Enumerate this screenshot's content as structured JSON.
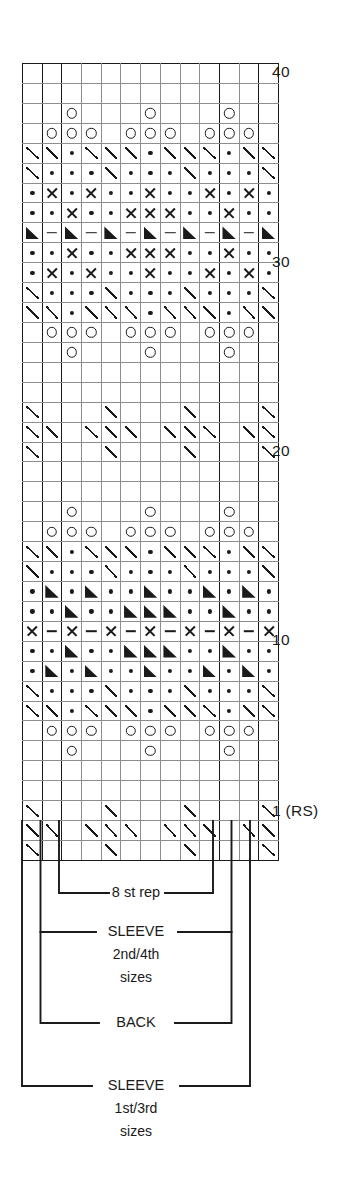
{
  "chart": {
    "columns": 13,
    "rows": 40,
    "row_labels": [
      {
        "row": 40,
        "text": "40"
      },
      {
        "row": 30,
        "text": "30"
      },
      {
        "row": 20,
        "text": "20"
      },
      {
        "row": 10,
        "text": "10"
      },
      {
        "row": 1,
        "text": "1 (RS)"
      }
    ],
    "heavy_column_lines": [
      0,
      1,
      2,
      10,
      12,
      13
    ],
    "symbol_legend": {
      "slash": "k2tog-decrease-slash",
      "dot": "purl-dot",
      "circle": "yarn-over-circle",
      "cross": "cross-x",
      "dash": "horizontal-dash",
      "tri": "filled-triangle",
      "blank": "knit-blank"
    },
    "grid": [
      [
        "blank",
        "blank",
        "blank",
        "blank",
        "blank",
        "blank",
        "blank",
        "blank",
        "blank",
        "blank",
        "blank",
        "blank",
        "blank"
      ],
      [
        "blank",
        "blank",
        "blank",
        "blank",
        "blank",
        "blank",
        "blank",
        "blank",
        "blank",
        "blank",
        "blank",
        "blank",
        "blank"
      ],
      [
        "blank",
        "blank",
        "circle",
        "blank",
        "blank",
        "blank",
        "circle",
        "blank",
        "blank",
        "blank",
        "circle",
        "blank",
        "blank"
      ],
      [
        "blank",
        "circle",
        "circle",
        "circle",
        "blank",
        "circle",
        "circle",
        "circle",
        "blank",
        "circle",
        "circle",
        "circle",
        "blank"
      ],
      [
        "slash",
        "slash",
        "dot",
        "slash",
        "slash",
        "slash",
        "dot",
        "slash",
        "slash",
        "slash",
        "dot",
        "slash",
        "slash"
      ],
      [
        "slash",
        "dot",
        "dot",
        "dot",
        "slash",
        "dot",
        "dot",
        "dot",
        "slash",
        "dot",
        "dot",
        "dot",
        "slash"
      ],
      [
        "dot",
        "cross",
        "dot",
        "cross",
        "dot",
        "dot",
        "cross",
        "dot",
        "dot",
        "cross",
        "dot",
        "cross",
        "dot"
      ],
      [
        "dot",
        "dot",
        "cross",
        "dot",
        "dot",
        "cross",
        "cross",
        "cross",
        "dot",
        "dot",
        "cross",
        "dot",
        "dot"
      ],
      [
        "tri",
        "dash",
        "tri",
        "dash",
        "tri",
        "dash",
        "tri",
        "dash",
        "tri",
        "dash",
        "tri",
        "dash",
        "tri"
      ],
      [
        "dot",
        "dot",
        "cross",
        "dot",
        "dot",
        "cross",
        "cross",
        "cross",
        "dot",
        "dot",
        "cross",
        "dot",
        "dot"
      ],
      [
        "dot",
        "cross",
        "dot",
        "cross",
        "dot",
        "dot",
        "cross",
        "dot",
        "dot",
        "cross",
        "dot",
        "cross",
        "dot"
      ],
      [
        "slash",
        "dot",
        "dot",
        "dot",
        "slash",
        "dot",
        "dot",
        "dot",
        "slash",
        "dot",
        "dot",
        "dot",
        "slash"
      ],
      [
        "slash",
        "slash",
        "dot",
        "slash",
        "slash",
        "slash",
        "dot",
        "slash",
        "slash",
        "slash",
        "dot",
        "slash",
        "slash"
      ],
      [
        "blank",
        "circle",
        "circle",
        "circle",
        "blank",
        "circle",
        "circle",
        "circle",
        "blank",
        "circle",
        "circle",
        "circle",
        "blank"
      ],
      [
        "blank",
        "blank",
        "circle",
        "blank",
        "blank",
        "blank",
        "circle",
        "blank",
        "blank",
        "blank",
        "circle",
        "blank",
        "blank"
      ],
      [
        "blank",
        "blank",
        "blank",
        "blank",
        "blank",
        "blank",
        "blank",
        "blank",
        "blank",
        "blank",
        "blank",
        "blank",
        "blank"
      ],
      [
        "blank",
        "blank",
        "blank",
        "blank",
        "blank",
        "blank",
        "blank",
        "blank",
        "blank",
        "blank",
        "blank",
        "blank",
        "blank"
      ],
      [
        "slash",
        "blank",
        "blank",
        "blank",
        "slash",
        "blank",
        "blank",
        "blank",
        "slash",
        "blank",
        "blank",
        "blank",
        "slash"
      ],
      [
        "slash",
        "slash",
        "blank",
        "slash",
        "slash",
        "slash",
        "blank",
        "slash",
        "slash",
        "slash",
        "blank",
        "slash",
        "slash"
      ],
      [
        "slash",
        "blank",
        "blank",
        "blank",
        "slash",
        "blank",
        "blank",
        "blank",
        "slash",
        "blank",
        "blank",
        "blank",
        "slash"
      ],
      [
        "blank",
        "blank",
        "blank",
        "blank",
        "blank",
        "blank",
        "blank",
        "blank",
        "blank",
        "blank",
        "blank",
        "blank",
        "blank"
      ],
      [
        "blank",
        "blank",
        "blank",
        "blank",
        "blank",
        "blank",
        "blank",
        "blank",
        "blank",
        "blank",
        "blank",
        "blank",
        "blank"
      ],
      [
        "blank",
        "blank",
        "circle",
        "blank",
        "blank",
        "blank",
        "circle",
        "blank",
        "blank",
        "blank",
        "circle",
        "blank",
        "blank"
      ],
      [
        "blank",
        "circle",
        "circle",
        "circle",
        "blank",
        "circle",
        "circle",
        "circle",
        "blank",
        "circle",
        "circle",
        "circle",
        "blank"
      ],
      [
        "slash",
        "slash",
        "dot",
        "slash",
        "slash",
        "slash",
        "dot",
        "slash",
        "slash",
        "slash",
        "dot",
        "slash",
        "slash"
      ],
      [
        "slash",
        "dot",
        "dot",
        "dot",
        "slash",
        "dot",
        "dot",
        "dot",
        "slash",
        "dot",
        "dot",
        "dot",
        "slash"
      ],
      [
        "dot",
        "tri",
        "dot",
        "tri",
        "dot",
        "dot",
        "tri",
        "dot",
        "dot",
        "tri",
        "dot",
        "tri",
        "dot"
      ],
      [
        "dot",
        "dot",
        "tri",
        "dot",
        "dot",
        "tri",
        "tri",
        "tri",
        "dot",
        "dot",
        "tri",
        "dot",
        "dot"
      ],
      [
        "cross",
        "dash",
        "cross",
        "dash",
        "cross",
        "dash",
        "cross",
        "dash",
        "cross",
        "dash",
        "cross",
        "dash",
        "cross"
      ],
      [
        "dot",
        "dot",
        "tri",
        "dot",
        "dot",
        "tri",
        "tri",
        "tri",
        "dot",
        "dot",
        "tri",
        "dot",
        "dot"
      ],
      [
        "dot",
        "tri",
        "dot",
        "tri",
        "dot",
        "dot",
        "tri",
        "dot",
        "dot",
        "tri",
        "dot",
        "tri",
        "dot"
      ],
      [
        "slash",
        "dot",
        "dot",
        "dot",
        "slash",
        "dot",
        "dot",
        "dot",
        "slash",
        "dot",
        "dot",
        "dot",
        "slash"
      ],
      [
        "slash",
        "slash",
        "dot",
        "slash",
        "slash",
        "slash",
        "dot",
        "slash",
        "slash",
        "slash",
        "dot",
        "slash",
        "slash"
      ],
      [
        "blank",
        "circle",
        "circle",
        "circle",
        "blank",
        "circle",
        "circle",
        "circle",
        "blank",
        "circle",
        "circle",
        "circle",
        "blank"
      ],
      [
        "blank",
        "blank",
        "circle",
        "blank",
        "blank",
        "blank",
        "circle",
        "blank",
        "blank",
        "blank",
        "circle",
        "blank",
        "blank"
      ],
      [
        "blank",
        "blank",
        "blank",
        "blank",
        "blank",
        "blank",
        "blank",
        "blank",
        "blank",
        "blank",
        "blank",
        "blank",
        "blank"
      ],
      [
        "blank",
        "blank",
        "blank",
        "blank",
        "blank",
        "blank",
        "blank",
        "blank",
        "blank",
        "blank",
        "blank",
        "blank",
        "blank"
      ],
      [
        "slash",
        "blank",
        "blank",
        "blank",
        "slash",
        "blank",
        "blank",
        "blank",
        "slash",
        "blank",
        "blank",
        "blank",
        "slash"
      ],
      [
        "slash",
        "slash",
        "blank",
        "slash",
        "slash",
        "slash",
        "blank",
        "slash",
        "slash",
        "slash",
        "blank",
        "slash",
        "slash"
      ],
      [
        "slash",
        "blank",
        "blank",
        "blank",
        "slash",
        "blank",
        "blank",
        "blank",
        "slash",
        "blank",
        "blank",
        "blank",
        "slash"
      ]
    ]
  },
  "brackets": [
    {
      "id": "st-rep",
      "label": "8 st rep",
      "sub": null
    },
    {
      "id": "sleeve-2nd4th",
      "label": "SLEEVE",
      "sub": "2nd/4th",
      "sub2": "sizes"
    },
    {
      "id": "back",
      "label": "BACK",
      "sub": null
    },
    {
      "id": "sleeve-1st3rd",
      "label": "SLEEVE",
      "sub": "1st/3rd",
      "sub2": "sizes"
    }
  ]
}
